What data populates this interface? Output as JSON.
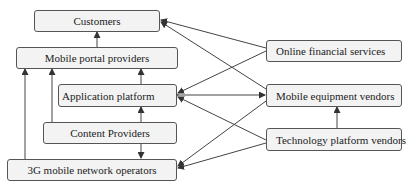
{
  "nodes": {
    "customers": "Customers",
    "mobile_portal": "Mobile portal providers",
    "application_platform": "Application platform",
    "content_providers": "Content Providers",
    "network_operators": "3G mobile network operators",
    "online_financial": "Online financial services",
    "mobile_equipment": "Mobile equipment vendors",
    "tech_platform": "Technology platform vendors"
  },
  "edges": [
    {
      "from": "Mobile portal providers",
      "to": "Customers"
    },
    {
      "from": "Application platform",
      "to": "Mobile portal providers"
    },
    {
      "from": "Content Providers",
      "to": "Mobile portal providers"
    },
    {
      "from": "3G mobile network operators",
      "to": "Mobile portal providers"
    },
    {
      "from": "Content Providers",
      "to": "Application platform"
    },
    {
      "from": "Content Providers",
      "to": "3G mobile network operators"
    },
    {
      "from": "Online financial services",
      "to": "Customers"
    },
    {
      "from": "Online financial services",
      "to": "Application platform"
    },
    {
      "from": "Mobile equipment vendors",
      "to": "Customers"
    },
    {
      "from": "Application platform",
      "to": "Mobile equipment vendors",
      "bidirectional": true
    },
    {
      "from": "Technology platform vendors",
      "to": "Application platform"
    },
    {
      "from": "Technology platform vendors",
      "to": "3G mobile network operators"
    },
    {
      "from": "Technology platform vendors",
      "to": "Mobile equipment vendors"
    },
    {
      "from": "Mobile equipment vendors",
      "to": "3G mobile network operators"
    }
  ],
  "colors": {
    "box_fill": "#f3f3f3",
    "border": "#555555",
    "line": "#444444"
  }
}
